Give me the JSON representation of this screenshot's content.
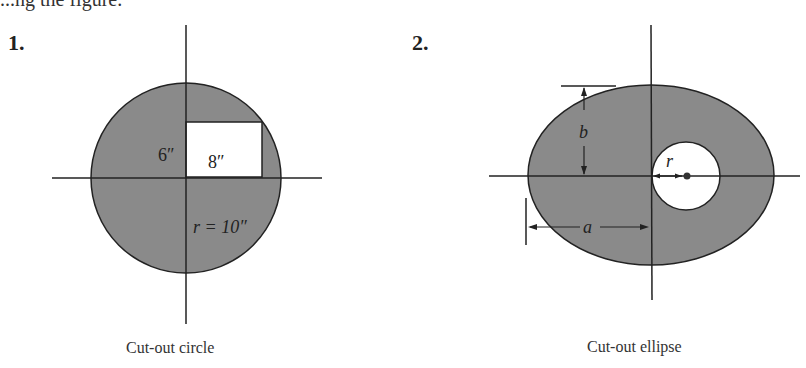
{
  "header_fragment": "...ng the figure.",
  "figures": [
    {
      "number": "1.",
      "caption": "Cut-out circle",
      "labels": {
        "height": "6″",
        "width": "8″",
        "radius": "r = 10″"
      },
      "shape": "circle",
      "cutout": "rectangle"
    },
    {
      "number": "2.",
      "caption": "Cut-out ellipse",
      "labels": {
        "semi_minor": "b",
        "semi_major": "a",
        "hole_radius": "r"
      },
      "shape": "ellipse",
      "cutout": "circle"
    }
  ],
  "colors": {
    "fill": "#8a8a8a",
    "stroke": "#222222",
    "background": "#ffffff"
  }
}
